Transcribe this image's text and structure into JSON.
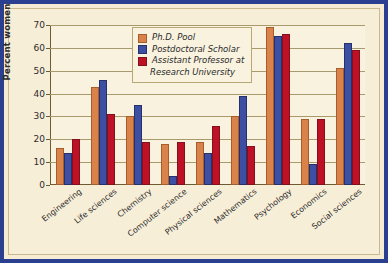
{
  "chart_data": {
    "type": "bar",
    "title": "",
    "xlabel": "",
    "ylabel": "Percent women",
    "ylim": [
      0,
      70
    ],
    "ytick_step": 10,
    "yticks": [
      0,
      10,
      20,
      30,
      40,
      50,
      60,
      70
    ],
    "grid": true,
    "legend_position": "top-center-inside",
    "categories": [
      "Engineering",
      "Life sciences",
      "Chemistry",
      "Computer science",
      "Physical sciences",
      "Mathematics",
      "Psychology",
      "Economics",
      "Social sciences"
    ],
    "series": [
      {
        "name": "Ph.D. Pool",
        "color": "#d9834a",
        "values": [
          16,
          43,
          30,
          18,
          19,
          30,
          69,
          29,
          51
        ]
      },
      {
        "name": "Postdoctoral Scholar",
        "color": "#3d4fa2",
        "values": [
          14,
          46,
          35,
          4,
          14,
          39,
          65,
          9,
          62
        ]
      },
      {
        "name": "Assistant Professor at Research University",
        "color": "#bf1126",
        "values": [
          20,
          31,
          19,
          19,
          26,
          17,
          66,
          29,
          59
        ]
      }
    ]
  },
  "legend": {
    "items": [
      {
        "label": "Ph.D. Pool",
        "label2": ""
      },
      {
        "label": "Postdoctoral Scholar",
        "label2": ""
      },
      {
        "label": "Assistant Professor at",
        "label2": "Research University"
      }
    ]
  },
  "colors": {
    "frame_border": "#2a3f8f",
    "background": "#f7eed8",
    "plot_background": "#f9f2df",
    "axis": "#6b5c33",
    "gridline": "#a89a6d",
    "series_0": "#d9834a",
    "series_1": "#3d4fa2",
    "series_2": "#bf1126"
  }
}
